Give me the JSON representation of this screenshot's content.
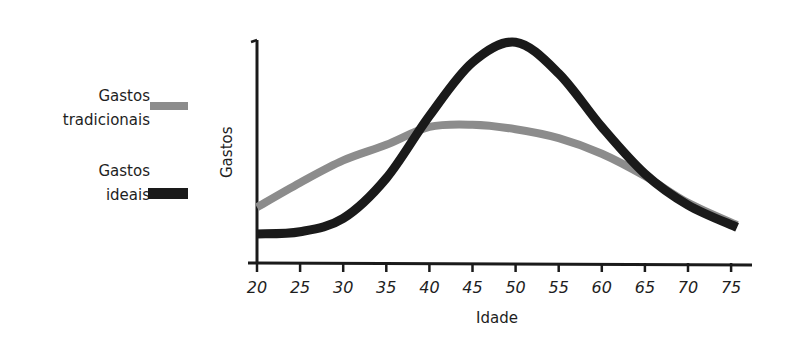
{
  "chart_data": {
    "type": "line",
    "title": "",
    "xlabel": "Idade",
    "ylabel": "Gastos",
    "x": [
      20,
      25,
      30,
      35,
      40,
      45,
      50,
      55,
      60,
      65,
      70,
      75
    ],
    "xlim": [
      20,
      76
    ],
    "ylim": [
      0,
      100
    ],
    "y_ticks_labeled": false,
    "grid": false,
    "legend_position": "left",
    "series": [
      {
        "name": "Gastos tradicionais",
        "color": "#8c8c8c",
        "values": [
          25,
          36,
          46,
          53,
          61,
          62,
          60,
          56,
          49,
          39,
          27,
          17
        ]
      },
      {
        "name": "Gastos ideais",
        "color": "#1a1a1a",
        "values": [
          13,
          14,
          20,
          38,
          66,
          90,
          99,
          85,
          61,
          40,
          26,
          16
        ]
      }
    ]
  },
  "legend": [
    {
      "line1": "Gastos",
      "line2": "tradicionais",
      "color": "#8c8c8c"
    },
    {
      "line1": "Gastos",
      "line2": "ideais",
      "color": "#1a1a1a"
    }
  ],
  "axes": {
    "xlabel": "Idade",
    "ylabel": "Gastos"
  }
}
